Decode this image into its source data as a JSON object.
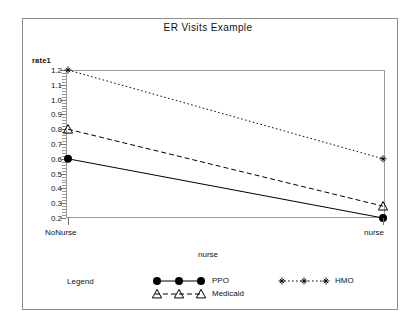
{
  "chart_data": {
    "type": "line",
    "title": "ER Visits Example",
    "xlabel": "nurse",
    "ylabel": "rate1",
    "categories": [
      "NoNurse",
      "nurse"
    ],
    "x": [
      0,
      1
    ],
    "ylim": [
      0.2,
      1.2
    ],
    "yticks": [
      0.2,
      0.3,
      0.4,
      0.5,
      0.6,
      0.7,
      0.8,
      0.9,
      1.0,
      1.1,
      1.2
    ],
    "ytick_labels": [
      "0.2",
      "0.3",
      "0.4",
      "0.5",
      "0.6",
      "0.7",
      "0.8",
      "0.9",
      "1.0",
      "1.1",
      "1.2"
    ],
    "grid": false,
    "legend_position": "bottom",
    "legend_title": "Legend",
    "series": [
      {
        "name": "PPO",
        "values": [
          0.6,
          0.2
        ],
        "marker": "filled-circle",
        "linestyle": "solid",
        "color": "#000000"
      },
      {
        "name": "Medicaid",
        "values": [
          0.8,
          0.28
        ],
        "marker": "open-triangle",
        "linestyle": "dashed",
        "color": "#000000"
      },
      {
        "name": "HMO",
        "values": [
          1.2,
          0.6
        ],
        "marker": "asterisk",
        "linestyle": "dash-dot",
        "color": "#000000"
      }
    ]
  },
  "chart": {
    "title": "ER Visits Example",
    "ylabel": "rate1",
    "xlabel": "nurse",
    "ytick_labels": [
      "1.2",
      "1.1",
      "1.0",
      "0.9",
      "0.8",
      "0.7",
      "0.6",
      "0.5",
      "0.4",
      "0.3",
      "0.2"
    ],
    "xtick_labels": [
      "NoNurse",
      "nurse"
    ]
  },
  "legend": {
    "title": "Legend",
    "ppo": "PPO",
    "medicaid": "Medicaid",
    "hmo": "HMO"
  }
}
